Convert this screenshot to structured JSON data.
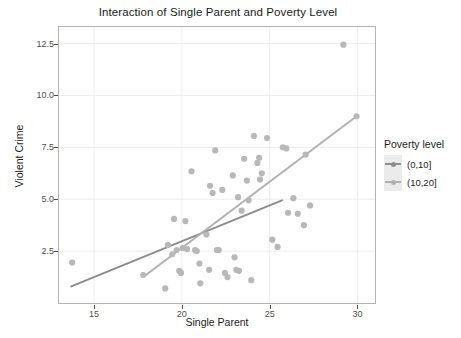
{
  "chart_data": {
    "type": "scatter",
    "title": "Interaction of Single Parent and Poverty Level",
    "xlabel": "Single Parent",
    "ylabel": "Violent Crime",
    "xlim": [
      13.0,
      31.0
    ],
    "ylim": [
      0.0,
      13.3
    ],
    "xticks": [
      15,
      20,
      25,
      30
    ],
    "xtick_labels": [
      "15",
      "20",
      "25",
      "30"
    ],
    "yticks": [
      2.5,
      5.0,
      7.5,
      10.0,
      12.5
    ],
    "ytick_labels": [
      "2.5",
      "5.0",
      "7.5",
      "10.0",
      "12.5"
    ],
    "grid": true,
    "legend_position": "right",
    "legend": {
      "title": "Poverty level",
      "entries": [
        {
          "label": "(0,10]",
          "color": "#8c8c8c"
        },
        {
          "label": "(10,20]",
          "color": "#b0b0b0"
        }
      ]
    },
    "points": [
      {
        "x": 13.75,
        "y": 1.95
      },
      {
        "x": 17.8,
        "y": 1.35
      },
      {
        "x": 19.05,
        "y": 0.7
      },
      {
        "x": 19.2,
        "y": 2.8
      },
      {
        "x": 19.45,
        "y": 2.35
      },
      {
        "x": 19.55,
        "y": 4.05
      },
      {
        "x": 19.7,
        "y": 2.55
      },
      {
        "x": 19.85,
        "y": 1.55
      },
      {
        "x": 19.95,
        "y": 1.45
      },
      {
        "x": 20.05,
        "y": 2.65
      },
      {
        "x": 20.2,
        "y": 3.95
      },
      {
        "x": 20.3,
        "y": 2.6
      },
      {
        "x": 20.55,
        "y": 6.35
      },
      {
        "x": 20.75,
        "y": 2.55
      },
      {
        "x": 20.85,
        "y": 2.5
      },
      {
        "x": 21.0,
        "y": 1.9
      },
      {
        "x": 21.05,
        "y": 0.95
      },
      {
        "x": 21.4,
        "y": 3.3
      },
      {
        "x": 21.55,
        "y": 1.6
      },
      {
        "x": 21.6,
        "y": 5.65
      },
      {
        "x": 21.75,
        "y": 5.3
      },
      {
        "x": 21.9,
        "y": 7.35
      },
      {
        "x": 22.0,
        "y": 2.55
      },
      {
        "x": 22.1,
        "y": 2.55
      },
      {
        "x": 22.3,
        "y": 5.45
      },
      {
        "x": 22.45,
        "y": 1.45
      },
      {
        "x": 22.6,
        "y": 1.25
      },
      {
        "x": 22.9,
        "y": 6.15
      },
      {
        "x": 23.0,
        "y": 2.2
      },
      {
        "x": 23.1,
        "y": 1.6
      },
      {
        "x": 23.2,
        "y": 5.1
      },
      {
        "x": 23.25,
        "y": 1.55
      },
      {
        "x": 23.4,
        "y": 4.45
      },
      {
        "x": 23.55,
        "y": 6.95
      },
      {
        "x": 23.7,
        "y": 5.9
      },
      {
        "x": 23.8,
        "y": 4.95
      },
      {
        "x": 23.95,
        "y": 1.1
      },
      {
        "x": 24.1,
        "y": 8.05
      },
      {
        "x": 24.3,
        "y": 6.75
      },
      {
        "x": 24.4,
        "y": 7.0
      },
      {
        "x": 24.45,
        "y": 5.95
      },
      {
        "x": 24.55,
        "y": 6.25
      },
      {
        "x": 24.85,
        "y": 7.95
      },
      {
        "x": 25.15,
        "y": 3.05
      },
      {
        "x": 25.45,
        "y": 2.7
      },
      {
        "x": 25.75,
        "y": 7.5
      },
      {
        "x": 25.95,
        "y": 7.45
      },
      {
        "x": 26.05,
        "y": 4.35
      },
      {
        "x": 26.35,
        "y": 5.05
      },
      {
        "x": 26.6,
        "y": 4.3
      },
      {
        "x": 26.95,
        "y": 3.75
      },
      {
        "x": 27.05,
        "y": 7.15
      },
      {
        "x": 27.3,
        "y": 4.7
      },
      {
        "x": 29.2,
        "y": 12.45
      },
      {
        "x": 29.95,
        "y": 9.0
      }
    ],
    "series": [
      {
        "name": "(0,10]",
        "type": "line",
        "color": "#8c8c8c",
        "x": [
          13.7,
          25.7
        ],
        "y": [
          0.8,
          4.95
        ]
      },
      {
        "name": "(10,20]",
        "type": "line",
        "color": "#b0b0b0",
        "x": [
          17.8,
          29.95
        ],
        "y": [
          1.25,
          9.0
        ]
      }
    ],
    "point_color": "#b8b8b8",
    "panel_background": "#ffffff",
    "grid_color": "#ededed",
    "panel_border_color": "#b4b4b4"
  }
}
